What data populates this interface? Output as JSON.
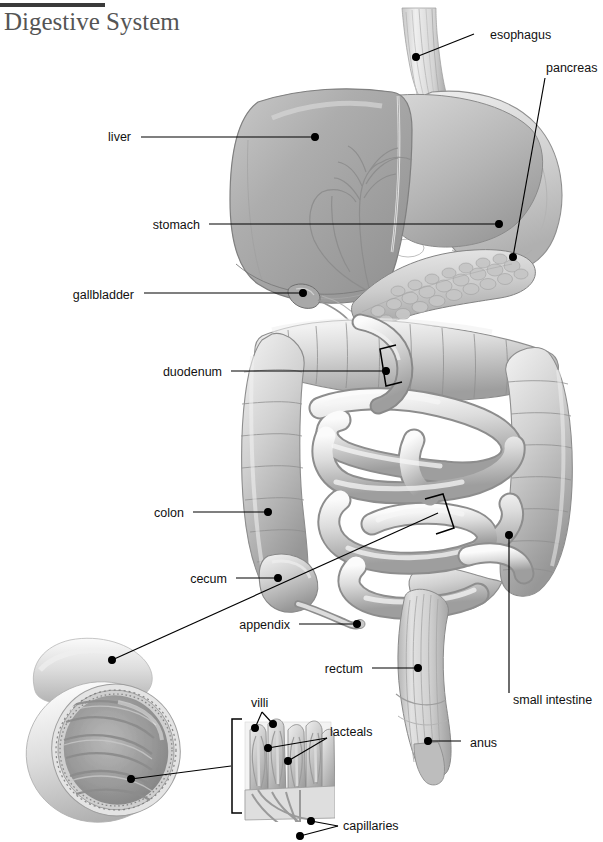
{
  "document": {
    "title": "Digestive System",
    "type": "anatomical-illustration",
    "subject": "human digestive system",
    "style": "grayscale medical illustration with leader-line labels"
  },
  "header": {
    "rule_color": "#3a3a3a",
    "title": "Digestive System"
  },
  "colors": {
    "background": "#ffffff",
    "label_text": "#111111",
    "leader_line": "#000000",
    "title_text": "#555555",
    "organ_light": "#e8e8e8",
    "organ_mid": "#b8b8b8",
    "organ_dark": "#8a8a8a",
    "organ_shadow": "#6d6d6d"
  },
  "labels": [
    {
      "id": "esophagus",
      "text": "esophagus",
      "align": "left",
      "x": 490,
      "y": 38,
      "dot_x": 416,
      "dot_y": 57,
      "elbow_x": 474,
      "elbow_y": 34
    },
    {
      "id": "pancreas",
      "text": "pancreas",
      "align": "left",
      "x": 546,
      "y": 71,
      "dot_x": 513,
      "dot_y": 257,
      "elbow_x": 545,
      "elbow_y": 78
    },
    {
      "id": "liver",
      "text": "liver",
      "align": "right",
      "x": 131,
      "y": 140,
      "dot_x": 315,
      "dot_y": 137,
      "elbow_x": 141,
      "elbow_y": 137
    },
    {
      "id": "stomach",
      "text": "stomach",
      "align": "right",
      "x": 200,
      "y": 228,
      "dot_x": 499,
      "dot_y": 224,
      "elbow_x": 209,
      "elbow_y": 224
    },
    {
      "id": "gallbladder",
      "text": "gallbladder",
      "align": "right",
      "x": 134,
      "y": 298,
      "dot_x": 303,
      "dot_y": 293,
      "elbow_x": 144,
      "elbow_y": 293
    },
    {
      "id": "duodenum",
      "text": "duodenum",
      "align": "right",
      "x": 222,
      "y": 375,
      "dot_x": 386,
      "dot_y": 371,
      "elbow_x": 231,
      "elbow_y": 371
    },
    {
      "id": "colon",
      "text": "colon",
      "align": "right",
      "x": 184,
      "y": 516,
      "dot_x": 268,
      "dot_y": 512,
      "elbow_x": 193,
      "elbow_y": 512
    },
    {
      "id": "cecum",
      "text": "cecum",
      "align": "right",
      "x": 227,
      "y": 582,
      "dot_x": 278,
      "dot_y": 578,
      "elbow_x": 236,
      "elbow_y": 578
    },
    {
      "id": "appendix",
      "text": "appendix",
      "align": "right",
      "x": 290,
      "y": 628,
      "dot_x": 357,
      "dot_y": 624,
      "elbow_x": 299,
      "elbow_y": 624
    },
    {
      "id": "rectum",
      "text": "rectum",
      "align": "right",
      "x": 363,
      "y": 672,
      "dot_x": 418,
      "dot_y": 668,
      "elbow_x": 372,
      "elbow_y": 668
    },
    {
      "id": "small-intestine",
      "text": "small intestine",
      "align": "left",
      "x": 513,
      "y": 703,
      "dot_x": 509,
      "dot_y": 535,
      "elbow_x": 509,
      "elbow_y": 693
    },
    {
      "id": "anus",
      "text": "anus",
      "align": "left",
      "x": 470,
      "y": 746,
      "dot_x": 428,
      "dot_y": 741,
      "elbow_x": 461,
      "elbow_y": 741
    },
    {
      "id": "villi",
      "text": "villi",
      "align": "left",
      "x": 251,
      "y": 706,
      "dot_x": 255,
      "dot_y": 728,
      "elbow_x": 262,
      "elbow_y": 712
    },
    {
      "id": "lacteals",
      "text": "lacteals",
      "align": "left",
      "x": 330,
      "y": 735,
      "dot_x": 288,
      "dot_y": 761,
      "elbow_x": 327,
      "elbow_y": 738
    },
    {
      "id": "capillaries",
      "text": "capillaries",
      "align": "left",
      "x": 343,
      "y": 829,
      "dot_x": 311,
      "dot_y": 821,
      "elbow_x": 338,
      "elbow_y": 826
    }
  ],
  "extra_leaders": [
    {
      "id": "villi-second",
      "from_x": 262,
      "from_y": 712,
      "to_x": 273,
      "to_y": 724
    },
    {
      "id": "lacteals-second",
      "from_x": 327,
      "from_y": 738,
      "to_x": 268,
      "to_y": 748
    },
    {
      "id": "capillaries-second",
      "from_x": 338,
      "from_y": 826,
      "to_x": 300,
      "to_y": 836
    }
  ],
  "callouts": [
    {
      "id": "colon-cross-section",
      "description": "cutaway cross-section of large intestine wall and lumen",
      "dot_x": 112,
      "dot_y": 660,
      "target_x": 438,
      "target_y": 513,
      "bracket": {
        "x": 425,
        "y": 500,
        "w": 28,
        "h": 40,
        "facing": "right"
      }
    },
    {
      "id": "villi-detail",
      "description": "microscopic villi with lacteals and capillaries",
      "dot_x": 131,
      "dot_y": 779,
      "target_x": 231,
      "target_y": 766,
      "bracket": {
        "x": 232,
        "y": 719,
        "w": 10,
        "h": 94,
        "facing": "left"
      }
    },
    {
      "id": "duodenum-bracket",
      "description": "bracket marking the duodenum segment",
      "bracket": {
        "x": 378,
        "y": 345,
        "w": 18,
        "h": 39,
        "facing": "left"
      }
    }
  ],
  "organs": [
    {
      "id": "esophagus",
      "name": "esophagus"
    },
    {
      "id": "liver",
      "name": "liver"
    },
    {
      "id": "stomach",
      "name": "stomach"
    },
    {
      "id": "gallbladder",
      "name": "gallbladder"
    },
    {
      "id": "pancreas",
      "name": "pancreas"
    },
    {
      "id": "duodenum",
      "name": "duodenum"
    },
    {
      "id": "small-intestine",
      "name": "small intestine"
    },
    {
      "id": "colon",
      "name": "colon"
    },
    {
      "id": "cecum",
      "name": "cecum"
    },
    {
      "id": "appendix",
      "name": "appendix"
    },
    {
      "id": "rectum",
      "name": "rectum"
    },
    {
      "id": "anus",
      "name": "anus"
    }
  ]
}
